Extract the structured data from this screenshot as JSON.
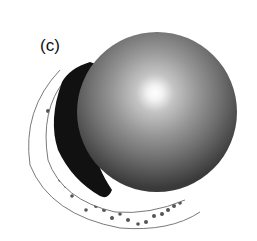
{
  "figure": {
    "panel_label": "(c)",
    "colors": {
      "background": "#ffffff",
      "sphere_highlight": "#ffffff",
      "sphere_mid": "#9a9a9a",
      "sphere_edge": "#3c3c3c",
      "shadow": "#101010",
      "shell_outline": "#777777",
      "dots": "#555555"
    },
    "sphere": {
      "cx": 157,
      "cy": 112,
      "r": 80,
      "highlight_cx": 155,
      "highlight_cy": 93
    },
    "shadow_region": {
      "description": "dark crescent shadow on left side of sphere"
    },
    "shell": {
      "description": "thin dotted crescent shell wrapping lower-left of sphere"
    }
  }
}
